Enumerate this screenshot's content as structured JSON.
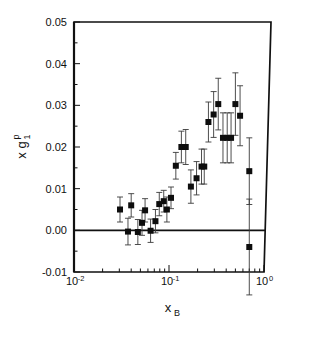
{
  "figure": {
    "name": "spin-structure-function-plot",
    "background": "#ffffff",
    "foreground": "#111111"
  },
  "chart_data": {
    "type": "scatter",
    "title": "",
    "xlabel": "x_B",
    "ylabel": "x g_1^p",
    "xlabel_base": "x",
    "xlabel_sub": "B",
    "ylabel_base": "x g",
    "ylabel_sub": "1",
    "ylabel_sup": "p",
    "xscale": "log",
    "yscale": "linear",
    "xlim": [
      0.01,
      1.0
    ],
    "ylim": [
      -0.01,
      0.05
    ],
    "grid": false,
    "legend": null,
    "zero_reference_line": 0.0,
    "xticks": [
      0.01,
      0.1,
      1.0
    ],
    "xtick_labels": [
      "10-2",
      "10-1",
      "100"
    ],
    "xtick_label_parts": [
      {
        "base": "10",
        "exp": "-2"
      },
      {
        "base": "10",
        "exp": "-1"
      },
      {
        "base": "10",
        "exp": "0"
      }
    ],
    "yticks": [
      -0.01,
      0.0,
      0.01,
      0.02,
      0.03,
      0.04,
      0.05
    ],
    "ytick_labels": [
      "-0.01",
      "0.00",
      "0.01",
      "0.02",
      "0.03",
      "0.04",
      "0.05"
    ],
    "yminor_ticks": [
      -0.005,
      0.005,
      0.015,
      0.025,
      0.035,
      0.045
    ],
    "marker_style": "filled-square",
    "marker_color": "#0d0d0d",
    "errorbar_color": "#3a3a3a",
    "series": [
      {
        "name": "x g1p",
        "points": [
          {
            "x": 0.0305,
            "y": 0.005,
            "yerr": 0.003
          },
          {
            "x": 0.037,
            "y": -0.0003,
            "yerr": 0.0032
          },
          {
            "x": 0.04,
            "y": 0.006,
            "yerr": 0.0028
          },
          {
            "x": 0.047,
            "y": -0.0004,
            "yerr": 0.003
          },
          {
            "x": 0.052,
            "y": 0.0018,
            "yerr": 0.003
          },
          {
            "x": 0.056,
            "y": 0.0048,
            "yerr": 0.0028
          },
          {
            "x": 0.064,
            "y": -0.0001,
            "yerr": 0.0028
          },
          {
            "x": 0.072,
            "y": 0.0022,
            "yerr": 0.0028
          },
          {
            "x": 0.079,
            "y": 0.0063,
            "yerr": 0.0028
          },
          {
            "x": 0.088,
            "y": 0.007,
            "yerr": 0.0026
          },
          {
            "x": 0.095,
            "y": 0.005,
            "yerr": 0.003
          },
          {
            "x": 0.105,
            "y": 0.0078,
            "yerr": 0.0026
          },
          {
            "x": 0.118,
            "y": 0.0155,
            "yerr": 0.0032
          },
          {
            "x": 0.135,
            "y": 0.02,
            "yerr": 0.0038
          },
          {
            "x": 0.15,
            "y": 0.02,
            "yerr": 0.0042
          },
          {
            "x": 0.17,
            "y": 0.0105,
            "yerr": 0.004
          },
          {
            "x": 0.195,
            "y": 0.0125,
            "yerr": 0.004
          },
          {
            "x": 0.22,
            "y": 0.0153,
            "yerr": 0.0042
          },
          {
            "x": 0.235,
            "y": 0.0153,
            "yerr": 0.0042
          },
          {
            "x": 0.26,
            "y": 0.026,
            "yerr": 0.0048
          },
          {
            "x": 0.295,
            "y": 0.0278,
            "yerr": 0.0055
          },
          {
            "x": 0.33,
            "y": 0.0303,
            "yerr": 0.0062
          },
          {
            "x": 0.37,
            "y": 0.0222,
            "yerr": 0.006
          },
          {
            "x": 0.41,
            "y": 0.0222,
            "yerr": 0.006
          },
          {
            "x": 0.45,
            "y": 0.0222,
            "yerr": 0.006
          },
          {
            "x": 0.5,
            "y": 0.0303,
            "yerr": 0.0075
          },
          {
            "x": 0.56,
            "y": 0.0275,
            "yerr": 0.0072
          },
          {
            "x": 0.7,
            "y": 0.0142,
            "yerr": 0.008
          },
          {
            "x": 0.7,
            "y": -0.004,
            "yerr": 0.0115
          }
        ]
      }
    ]
  }
}
